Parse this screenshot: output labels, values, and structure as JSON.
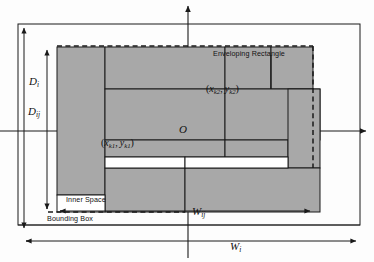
{
  "diagram": {
    "type": "packing-layout",
    "origin_label": "O",
    "colors": {
      "item_fill": "#a8a8a8",
      "item_stroke": "#1a1a1a",
      "inner_space_fill": "#ffffff",
      "axis": "#1a1a1a",
      "dashed": "#1a1a1a",
      "outer_frame": "#1a1a1a",
      "background": "#fdfdfd"
    },
    "labels": {
      "enveloping_rectangle": "Enveloping Rectangle",
      "inner_space": "Inner Space",
      "bounding_box": "Bounding Box",
      "origin": "O"
    },
    "coordinates": [
      {
        "name": "point-k1",
        "x_var": "x",
        "x_sub": "k1",
        "y_var": "y",
        "y_sub": "k1"
      },
      {
        "name": "point-k2",
        "x_var": "x",
        "x_sub": "k2",
        "y_var": "y",
        "y_sub": "k2"
      }
    ],
    "dimensions": [
      {
        "name": "depth-outer",
        "var": "D",
        "sub": "i",
        "orientation": "vertical"
      },
      {
        "name": "depth-inner",
        "var": "D",
        "sub": "ij",
        "orientation": "vertical"
      },
      {
        "name": "width-inner",
        "var": "W",
        "sub": "ij",
        "orientation": "horizontal"
      },
      {
        "name": "width-outer",
        "var": "W",
        "sub": "i",
        "orientation": "horizontal"
      }
    ],
    "axes": {
      "x_axis": "horizontal axis through origin",
      "y_axis": "vertical axis through origin"
    }
  }
}
